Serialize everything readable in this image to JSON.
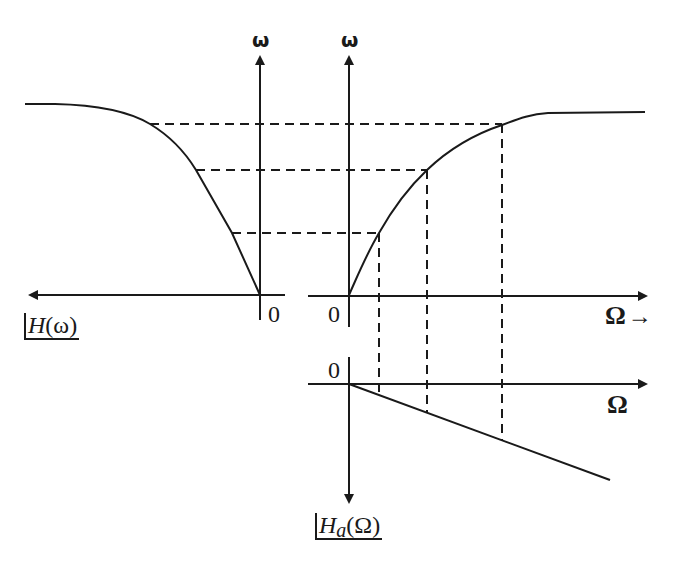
{
  "diagram": {
    "title": "",
    "colors": {
      "stroke": "#1a1a1a",
      "background": "#ffffff"
    },
    "labels": {
      "left_vertical_axis": "ω",
      "right_vertical_axis": "ω",
      "left_origin": "0",
      "right_top_origin": "0",
      "right_bottom_origin": "0",
      "top_horizontal_axis": "Ω",
      "top_horizontal_arrow": "→",
      "bottom_horizontal_axis": "Ω",
      "left_function_name": "H",
      "left_function_arg": "(ω)",
      "bottom_function_name": "H",
      "bottom_function_subscript": "a",
      "bottom_function_arg": "(Ω)"
    },
    "panels": [
      {
        "name": "magnitude-response-H-omega",
        "description": "Lowpass-like magnitude |H(ω)| plotted leftwards along horizontal axis, ω vertical",
        "axis_label_vertical": "ω",
        "axis_label_horizontal": "|H(ω)|"
      },
      {
        "name": "frequency-mapping-curve",
        "description": "Nonlinear mapping ω = f(Ω), saturating curve",
        "axis_label_vertical": "ω",
        "axis_label_horizontal": "Ω"
      },
      {
        "name": "magnitude-response-Ha-Omega",
        "description": "Linear magnitude |Ha(Ω)| plotted downward vs Ω",
        "axis_label_vertical": "|Ha(Ω)|",
        "axis_label_horizontal": "Ω"
      }
    ],
    "projection_levels": 3
  }
}
